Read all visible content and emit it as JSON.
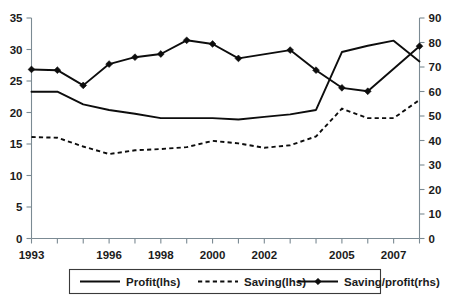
{
  "chart_data": {
    "type": "line",
    "title": "",
    "xlabel": "",
    "ylabel": "",
    "y2label": "",
    "grid": false,
    "legend_position": "bottom",
    "x": [
      1993,
      1994,
      1995,
      1996,
      1997,
      1998,
      1999,
      2000,
      2001,
      2002,
      2003,
      2004,
      2005,
      2006,
      2007,
      2008
    ],
    "x_tick_labels": [
      "1993",
      "",
      "",
      "1996",
      "",
      "1998",
      "",
      "2000",
      "",
      "2002",
      "",
      "",
      "2005",
      "",
      "2007",
      ""
    ],
    "xlim": [
      1993,
      2008
    ],
    "ylim": [
      0,
      35
    ],
    "y_ticks": [
      0,
      5,
      10,
      15,
      20,
      25,
      30,
      35
    ],
    "y_tick_labels": [
      "0",
      "5",
      "10",
      "15",
      "20",
      "25",
      "30",
      "35"
    ],
    "y2lim": [
      0,
      90
    ],
    "y2_ticks": [
      0,
      10,
      20,
      30,
      40,
      50,
      60,
      70,
      80,
      90
    ],
    "y2_tick_labels": [
      "0",
      "10",
      "20",
      "30",
      "40",
      "50",
      "60",
      "70",
      "80",
      "90"
    ],
    "series": [
      {
        "name": "Profit(lhs)",
        "axis": "left",
        "style": "solid",
        "marker": "none",
        "color": "#0d0d0d",
        "values": [
          23.3,
          23.3,
          21.3,
          20.4,
          19.8,
          19.1,
          19.1,
          19.1,
          18.9,
          19.3,
          19.7,
          20.4,
          29.6,
          30.6,
          31.4,
          28.1
        ]
      },
      {
        "name": "Saving(lhs)",
        "axis": "left",
        "style": "dashed",
        "marker": "none",
        "color": "#0d0d0d",
        "values": [
          16.1,
          16.0,
          14.6,
          13.4,
          14.0,
          14.2,
          14.5,
          15.5,
          15.1,
          14.4,
          14.8,
          16.2,
          20.6,
          19.1,
          19.1,
          22.0
        ]
      },
      {
        "name": "Saving/profit(rhs)",
        "axis": "right",
        "style": "solid",
        "marker": "diamond",
        "color": "#0d0d0d",
        "values": [
          69.0,
          68.7,
          62.5,
          71.2,
          74.0,
          75.3,
          80.9,
          79.4,
          73.5,
          76.9,
          68.7,
          61.5,
          60.1,
          78.5
        ],
        "x_values": [
          1993,
          1994,
          1995,
          1996,
          1997,
          1998,
          1999,
          2000,
          2001,
          2003,
          2004,
          2005,
          2006,
          2008
        ]
      }
    ],
    "legend": [
      {
        "label": "Profit(lhs)",
        "style": "solid",
        "marker": "none"
      },
      {
        "label": "Saving(lhs)",
        "style": "dashed",
        "marker": "none"
      },
      {
        "label": "Saving/profit(rhs)",
        "style": "solid",
        "marker": "diamond"
      }
    ],
    "colors": {
      "series": "#0d0d0d",
      "axis": "#7b8a93",
      "text": "#1b1b1b",
      "background": "#ffffff"
    }
  }
}
